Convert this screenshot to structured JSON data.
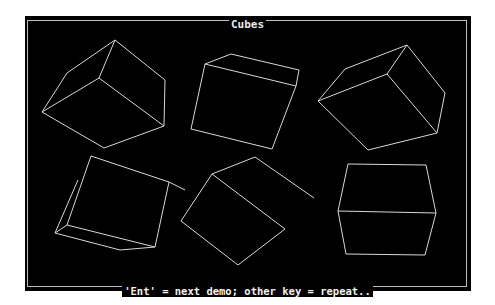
{
  "window": {
    "title": "Cubes",
    "footer": "'Ent' = next demo; other key = repeat.."
  },
  "colors": {
    "background": "#000000",
    "lines": "#d8d8d8",
    "frame": "#bdbdbd"
  },
  "cubes": [
    {
      "name": "cube-1",
      "lines": [
        [
          115,
          40,
          165,
          80
        ],
        [
          165,
          80,
          164,
          126
        ],
        [
          164,
          126,
          104,
          148
        ],
        [
          104,
          148,
          42,
          112
        ],
        [
          42,
          112,
          67,
          73
        ],
        [
          67,
          73,
          115,
          40
        ],
        [
          115,
          40,
          99,
          78
        ],
        [
          99,
          78,
          42,
          112
        ],
        [
          99,
          78,
          164,
          126
        ]
      ]
    },
    {
      "name": "cube-2",
      "lines": [
        [
          231,
          54,
          299,
          70
        ],
        [
          299,
          70,
          296,
          86
        ],
        [
          296,
          86,
          205,
          64
        ],
        [
          205,
          64,
          231,
          54
        ],
        [
          205,
          64,
          191,
          129
        ],
        [
          191,
          129,
          272,
          149
        ],
        [
          272,
          149,
          296,
          86
        ]
      ]
    },
    {
      "name": "cube-3",
      "lines": [
        [
          407,
          45,
          445,
          93
        ],
        [
          445,
          93,
          437,
          133
        ],
        [
          437,
          133,
          368,
          150
        ],
        [
          368,
          150,
          318,
          101
        ],
        [
          318,
          101,
          387,
          74
        ],
        [
          387,
          74,
          437,
          133
        ],
        [
          387,
          74,
          407,
          45
        ],
        [
          345,
          69,
          407,
          45
        ],
        [
          318,
          101,
          345,
          69
        ]
      ]
    },
    {
      "name": "cube-4",
      "lines": [
        [
          91,
          156,
          169,
          182
        ],
        [
          169,
          182,
          155,
          247
        ],
        [
          155,
          247,
          67,
          225
        ],
        [
          67,
          225,
          91,
          156
        ],
        [
          55,
          233,
          120,
          250
        ],
        [
          120,
          250,
          155,
          247
        ],
        [
          55,
          233,
          78,
          180
        ],
        [
          55,
          233,
          67,
          225
        ],
        [
          169,
          182,
          185,
          190
        ]
      ]
    },
    {
      "name": "cube-5",
      "lines": [
        [
          255,
          157,
          314,
          198
        ],
        [
          255,
          157,
          212,
          174
        ],
        [
          212,
          174,
          285,
          229
        ],
        [
          285,
          229,
          238,
          265
        ],
        [
          238,
          265,
          181,
          221
        ],
        [
          181,
          221,
          212,
          174
        ]
      ]
    },
    {
      "name": "cube-6",
      "lines": [
        [
          348,
          164,
          426,
          165
        ],
        [
          426,
          165,
          436,
          213
        ],
        [
          436,
          213,
          338,
          211
        ],
        [
          338,
          211,
          348,
          164
        ],
        [
          338,
          211,
          346,
          254
        ],
        [
          346,
          254,
          425,
          255
        ],
        [
          425,
          255,
          436,
          213
        ]
      ]
    }
  ]
}
